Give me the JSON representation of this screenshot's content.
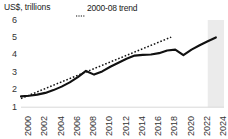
{
  "chart_data": {
    "type": "line",
    "title": "",
    "subtitle": "",
    "ylabel": "US$, trillions",
    "xlabel": "",
    "ylim": [
      1,
      6
    ],
    "xlim": [
      2000,
      2025
    ],
    "grid": false,
    "legend_position": "top-center",
    "y_ticks": [
      6,
      5,
      4,
      3,
      2,
      1
    ],
    "x_ticks": [
      2000,
      2002,
      2004,
      2006,
      2008,
      2010,
      2012,
      2014,
      2016,
      2018,
      2020,
      2022,
      2024
    ],
    "x": [
      2000,
      2001,
      2002,
      2003,
      2004,
      2005,
      2006,
      2007,
      2008,
      2009,
      2010,
      2011,
      2012,
      2013,
      2014,
      2015,
      2016,
      2017,
      2018,
      2019,
      2020,
      2021,
      2022,
      2023,
      2024
    ],
    "series": [
      {
        "name": "actual",
        "style": "solid",
        "color": "#111111",
        "values": [
          1.62,
          1.66,
          1.72,
          1.82,
          1.98,
          2.18,
          2.42,
          2.72,
          3.08,
          2.87,
          3.05,
          3.32,
          3.55,
          3.78,
          3.96,
          4.0,
          4.02,
          4.1,
          4.25,
          4.3,
          3.98,
          4.3,
          4.55,
          4.78,
          5.0
        ]
      },
      {
        "name": "2000-08 trend",
        "style": "dotted",
        "color": "#111111",
        "x": [
          2000,
          2018.5
        ],
        "values": [
          1.5,
          5.02
        ]
      }
    ],
    "shaded_band": {
      "label": "forecast",
      "x_start": 2023.0,
      "x_end": 2025.0,
      "color": "#ebebeb"
    },
    "legend": [
      {
        "label": "2000-08 trend",
        "marker": "dotted-line"
      }
    ]
  }
}
